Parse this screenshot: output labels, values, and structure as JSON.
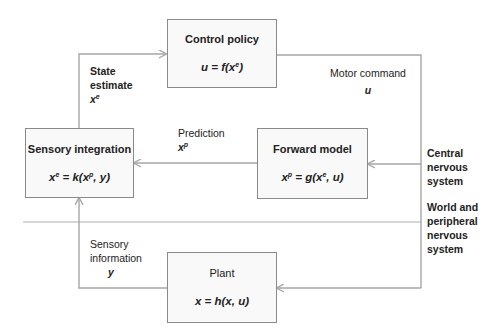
{
  "diagram": {
    "type": "block-diagram",
    "colors": {
      "line": "#a6a6a6",
      "box_border": "#8a8a8a",
      "box_fill": "#f9f9f9",
      "text": "#222222"
    },
    "boxes": {
      "control_policy": {
        "title": "Control policy",
        "eq_lhs": "u = f(x",
        "eq_sup": "e",
        "eq_rhs": ")"
      },
      "sensory_integration": {
        "title": "Sensory integration",
        "eq_a": "x",
        "eq_a_sup": "e",
        "eq_b": " = k(x",
        "eq_b_sup": "p",
        "eq_c": ", y)"
      },
      "forward_model": {
        "title": "Forward model",
        "eq_a": "x",
        "eq_a_sup": "p",
        "eq_b": " = g(x",
        "eq_b_sup": "e",
        "eq_c": ", u)"
      },
      "plant": {
        "title": "Plant",
        "eq": "x = h(x, u)"
      }
    },
    "signals": {
      "state_estimate": {
        "line1": "State",
        "line2": "estimate",
        "var": "x",
        "var_sup": "e"
      },
      "motor_command": {
        "label": "Motor command",
        "var": "u"
      },
      "prediction": {
        "label": "Prediction",
        "var": "x",
        "var_sup": "p"
      },
      "sensory_information": {
        "line1": "Sensory",
        "line2": "information",
        "var": "y"
      }
    },
    "regions": {
      "central": {
        "line1": "Central",
        "line2": "nervous",
        "line3": "system"
      },
      "peripheral": {
        "line1": "World and",
        "line2": "peripheral",
        "line3": "nervous",
        "line4": "system"
      }
    }
  }
}
